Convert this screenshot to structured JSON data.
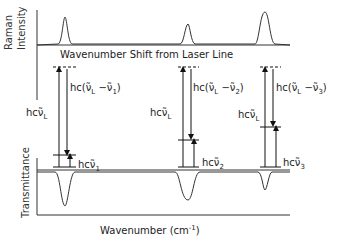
{
  "raman_panel": {
    "ylabel_line1": "Raman",
    "ylabel_line2": "Intensity",
    "xlabel": "Wavenumber Shift from Laser Line"
  },
  "ir_panel": {
    "ylabel": "Transmittance",
    "xlabel": "Wavenumber (cm",
    "xlabel_sup": "-1",
    "xlabel_end": ")"
  },
  "transitions": [
    {
      "id": 1,
      "laser_label": "hcν̃",
      "laser_sub": "L",
      "diff_label": "hc(ν̃",
      "diff_sub_L": "L",
      "diff_mid": " −ν̃",
      "diff_sub_n": "1",
      "diff_end": ")",
      "vib_label": "hcν̃",
      "vib_sub": "1"
    },
    {
      "id": 2,
      "laser_label": "hcν̃",
      "laser_sub": "L",
      "diff_label": "hc(ν̃",
      "diff_sub_L": "L",
      "diff_mid": " −ν̃",
      "diff_sub_n": "2",
      "diff_end": ")",
      "vib_label": "hcν̃",
      "vib_sub": "2"
    },
    {
      "id": 3,
      "laser_label": "hcν̃",
      "laser_sub": "L",
      "diff_label": "hc(ν̃",
      "diff_sub_L": "L",
      "diff_mid": " −ν̃",
      "diff_sub_n": "3",
      "diff_end": ")",
      "vib_label": "hcν̃",
      "vib_sub": "3"
    }
  ]
}
